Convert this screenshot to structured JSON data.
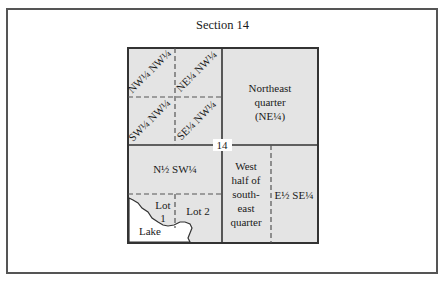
{
  "diagram": {
    "title": "Section 14",
    "section_number": "14",
    "colors": {
      "fill": "#e4e4e4",
      "line": "#333333",
      "lake": "#ffffff",
      "frame": "#555555"
    },
    "nw_quarter": {
      "subdivisions": [
        {
          "id": "nw-nw",
          "label": "NW¼ NW¼"
        },
        {
          "id": "ne-nw",
          "label": "NE¼ NW¼"
        },
        {
          "id": "sw-nw",
          "label": "SW¼ NW¼"
        },
        {
          "id": "se-nw",
          "label": "SE¼ NW¼"
        }
      ]
    },
    "ne_quarter": {
      "lines": [
        "Northeast",
        "quarter",
        "(NE¼)"
      ]
    },
    "sw_quarter": {
      "north_half_label": "N½ SW¼",
      "lot1_lines": [
        "Lot",
        "1"
      ],
      "lot2_label": "Lot 2",
      "lake_label": "Lake"
    },
    "se_quarter": {
      "west_half_lines": [
        "West",
        "half of",
        "south-",
        "east",
        "quarter"
      ],
      "east_half_label": "E½ SE¼"
    }
  }
}
